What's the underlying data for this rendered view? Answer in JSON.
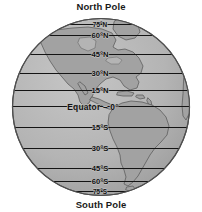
{
  "figure": {
    "title_top": "North Pole",
    "title_bottom": "South Pole",
    "projection": "orthographic globe centered on the Americas",
    "colors": {
      "ocean": "#b3b3b3",
      "land": "#a3a3a3",
      "outline": "#4d4d4d",
      "gridline": "#1a1a1a",
      "background": "#ffffff",
      "text": "#111111"
    }
  },
  "latitudes": [
    {
      "id": "n75",
      "label": "75°N",
      "value": 75,
      "x": 100,
      "y": 24.5,
      "size": "tiny"
    },
    {
      "id": "n60",
      "label": "60°N",
      "value": 60,
      "x": 100,
      "y": 35.5,
      "size": "normal"
    },
    {
      "id": "n45",
      "label": "45°N",
      "value": 45,
      "x": 100,
      "y": 54.5,
      "size": "normal"
    },
    {
      "id": "n30",
      "label": "30°N",
      "value": 30,
      "x": 100,
      "y": 73.5,
      "size": "normal"
    },
    {
      "id": "n15",
      "label": "15°N",
      "value": 15,
      "x": 100,
      "y": 90.5,
      "size": "normal"
    },
    {
      "id": "eq",
      "label": "Equator – 0°",
      "value": 0,
      "x": 93,
      "y": 106.5,
      "size": "equator"
    },
    {
      "id": "s15",
      "label": "15°S",
      "value": -15,
      "x": 100,
      "y": 127.5,
      "size": "normal"
    },
    {
      "id": "s30",
      "label": "30°S",
      "value": -30,
      "x": 100,
      "y": 148.5,
      "size": "normal"
    },
    {
      "id": "s45",
      "label": "45°S",
      "value": -45,
      "x": 100,
      "y": 168.5,
      "size": "normal"
    },
    {
      "id": "s60",
      "label": "60°S",
      "value": -60,
      "x": 100,
      "y": 181.5,
      "size": "normal"
    },
    {
      "id": "s75",
      "label": "75°S",
      "value": -75,
      "x": 100,
      "y": 191.5,
      "size": "tiny"
    }
  ]
}
